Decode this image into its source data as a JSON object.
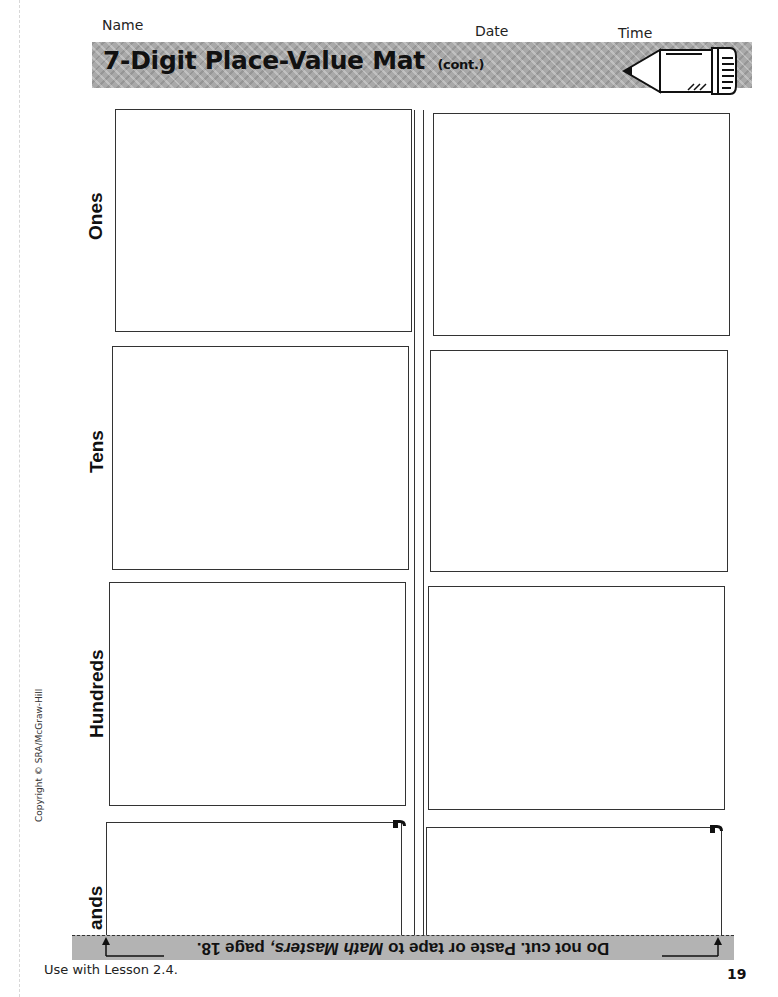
{
  "header": {
    "name_label": "Name",
    "date_label": "Date",
    "time_label": "Time",
    "title": "7-Digit Place-Value Mat",
    "title_suffix": "(cont.)",
    "icon": "pencil-icon"
  },
  "mat": {
    "rows": [
      {
        "label": "Ones"
      },
      {
        "label": "Tens"
      },
      {
        "label": "Hundreds"
      },
      {
        "label": "ands"
      }
    ],
    "columns": 2,
    "divider": "double-vertical-line"
  },
  "side_note": {
    "copyright": "Copyright © SRA/McGraw-Hill"
  },
  "footer": {
    "instruction_prefix": "Do not cut. Paste or tape to",
    "instruction_italic": "Math Masters,",
    "instruction_suffix": "page 18.",
    "instruction_orientation": "upside-down",
    "lesson": "Use with Lesson 2.4.",
    "page_number": "19"
  },
  "colors": {
    "title_bar": "#a9a9a9",
    "footer_bar": "#b3b3b3",
    "lines": "#333333",
    "background": "#ffffff"
  }
}
